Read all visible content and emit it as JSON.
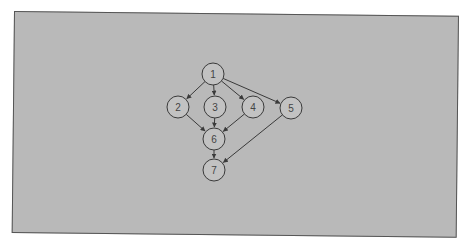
{
  "diagram": {
    "type": "directed-graph",
    "colors": {
      "background": "#b9b9b9",
      "node_fill": "#c2c2c2",
      "node_stroke": "#3a3a3a",
      "edge": "#3a3a3a"
    },
    "nodes": [
      {
        "id": "1",
        "label": "1",
        "x": 213,
        "y": 74
      },
      {
        "id": "2",
        "label": "2",
        "x": 178,
        "y": 107
      },
      {
        "id": "3",
        "label": "3",
        "x": 215,
        "y": 107
      },
      {
        "id": "4",
        "label": "4",
        "x": 253,
        "y": 107
      },
      {
        "id": "5",
        "label": "5",
        "x": 291,
        "y": 108
      },
      {
        "id": "6",
        "label": "6",
        "x": 214,
        "y": 139
      },
      {
        "id": "7",
        "label": "7",
        "x": 214,
        "y": 170
      }
    ],
    "edges": [
      {
        "from": "1",
        "to": "2"
      },
      {
        "from": "1",
        "to": "3"
      },
      {
        "from": "1",
        "to": "4"
      },
      {
        "from": "1",
        "to": "5"
      },
      {
        "from": "2",
        "to": "6"
      },
      {
        "from": "3",
        "to": "6"
      },
      {
        "from": "4",
        "to": "6"
      },
      {
        "from": "6",
        "to": "7"
      },
      {
        "from": "5",
        "to": "7"
      }
    ]
  }
}
